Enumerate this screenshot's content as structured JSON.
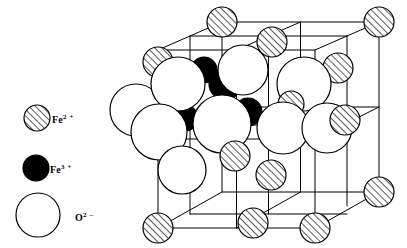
{
  "figure": {
    "background_color": "#ffffff",
    "line_color": "#000000",
    "width": 407,
    "height": 248
  },
  "legend": {
    "name": "ion-species-legend",
    "entries": [
      {
        "key": "fe2",
        "symbol_text": "Fe",
        "charge_text": "2 +",
        "full_label": "Fe2+",
        "marker": "hatched-circle",
        "fill_color": "#ffffff",
        "hatch_color": "#000000",
        "stroke_color": "#000000",
        "radius": 13,
        "cx": 37,
        "cy": 118
      },
      {
        "key": "fe3",
        "symbol_text": "Fe",
        "charge_text": "3 +",
        "full_label": "Fe3+",
        "marker": "solid-circle",
        "fill_color": "#000000",
        "stroke_color": "#000000",
        "radius": 13,
        "cx": 36,
        "cy": 168
      },
      {
        "key": "o2",
        "symbol_text": "O",
        "charge_text": "2 –",
        "full_label": "O2-",
        "marker": "open-circle",
        "fill_color": "#ffffff",
        "stroke_color": "#000000",
        "radius": 22,
        "cx": 38,
        "cy": 215
      }
    ]
  },
  "cell": {
    "name": "unit-cell-wireframe",
    "vertices": {
      "front_bottom_left": [
        158,
        228
      ],
      "front_bottom_right": [
        315,
        228
      ],
      "front_top_left": [
        158,
        50
      ],
      "front_top_right": [
        315,
        50
      ],
      "back_bottom_left": [
        222,
        192
      ],
      "back_bottom_right": [
        379,
        192
      ],
      "back_top_left": [
        222,
        22
      ],
      "back_top_right": [
        379,
        22
      ]
    },
    "internal_grid": true,
    "subdivisions": 2
  },
  "chart_data": {
    "type": "scatter",
    "xlabel": "",
    "ylabel": "",
    "ions": [
      {
        "id": "fe2-back-top-left",
        "species": "fe2",
        "cx": 222,
        "cy": 22,
        "r": 15,
        "z": 3
      },
      {
        "id": "fe2-back-top-right",
        "species": "fe2",
        "cx": 379,
        "cy": 22,
        "r": 15,
        "z": 3
      },
      {
        "id": "fe2-top-face-center",
        "species": "fe2",
        "cx": 272,
        "cy": 42,
        "r": 15,
        "z": 3
      },
      {
        "id": "fe2-left-edge-mid",
        "species": "fe2",
        "cx": 158,
        "cy": 62,
        "r": 15,
        "z": 4
      },
      {
        "id": "fe2-right-upper",
        "species": "fe2",
        "cx": 338,
        "cy": 68,
        "r": 15,
        "z": 4
      },
      {
        "id": "fe2-inner-right",
        "species": "fe2",
        "cx": 291,
        "cy": 104,
        "r": 13,
        "z": 7
      },
      {
        "id": "fe2-right-face-center",
        "species": "fe2",
        "cx": 345,
        "cy": 120,
        "r": 15,
        "z": 9
      },
      {
        "id": "fe2-front-inner-low",
        "species": "fe2",
        "cx": 235,
        "cy": 156,
        "r": 15,
        "z": 9
      },
      {
        "id": "fe2-back-bottom-mid",
        "species": "fe2",
        "cx": 271,
        "cy": 175,
        "r": 15,
        "z": 9
      },
      {
        "id": "fe2-back-bottom-right",
        "species": "fe2",
        "cx": 379,
        "cy": 192,
        "r": 15,
        "z": 9
      },
      {
        "id": "fe2-front-bottom-left",
        "species": "fe2",
        "cx": 158,
        "cy": 228,
        "r": 15,
        "z": 9
      },
      {
        "id": "fe2-bottom-face-center",
        "species": "fe2",
        "cx": 253,
        "cy": 223,
        "r": 15,
        "z": 9
      },
      {
        "id": "fe2-front-bottom-right",
        "species": "fe2",
        "cx": 315,
        "cy": 228,
        "r": 15,
        "z": 9
      },
      {
        "id": "fe3-upper-left",
        "species": "fe3",
        "cx": 204,
        "cy": 70,
        "r": 13,
        "z": 5
      },
      {
        "id": "fe3-upper-center",
        "species": "fe3",
        "cx": 225,
        "cy": 84,
        "r": 16,
        "z": 5
      },
      {
        "id": "fe3-mid-left",
        "species": "fe3",
        "cx": 185,
        "cy": 118,
        "r": 13,
        "z": 5
      },
      {
        "id": "fe3-mid-center",
        "species": "fe3",
        "cx": 248,
        "cy": 112,
        "r": 14,
        "z": 5
      },
      {
        "id": "o2-left-clip",
        "species": "o2",
        "cx": 136,
        "cy": 110,
        "r": 26,
        "z": 6
      },
      {
        "id": "o2-upper-left",
        "species": "o2",
        "cx": 178,
        "cy": 84,
        "r": 27,
        "z": 6
      },
      {
        "id": "o2-upper-mid",
        "species": "o2",
        "cx": 243,
        "cy": 70,
        "r": 25,
        "z": 6
      },
      {
        "id": "o2-upper-right",
        "species": "o2",
        "cx": 304,
        "cy": 84,
        "r": 27,
        "z": 6
      },
      {
        "id": "o2-left-big",
        "species": "o2",
        "cx": 159,
        "cy": 132,
        "r": 28,
        "z": 8
      },
      {
        "id": "o2-center-big",
        "species": "o2",
        "cx": 222,
        "cy": 124,
        "r": 29,
        "z": 8
      },
      {
        "id": "o2-center-right",
        "species": "o2",
        "cx": 283,
        "cy": 128,
        "r": 26,
        "z": 8
      },
      {
        "id": "o2-right-lower",
        "species": "o2",
        "cx": 327,
        "cy": 128,
        "r": 25,
        "z": 8
      },
      {
        "id": "o2-lower-left",
        "species": "o2",
        "cx": 182,
        "cy": 170,
        "r": 24,
        "z": 8
      }
    ]
  }
}
